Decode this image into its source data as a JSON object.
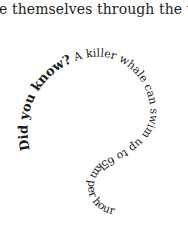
{
  "document": {
    "body_line": "e themselves through the water",
    "curved_text": {
      "lead": "Did you know?",
      "rest": " A killer whale can swim up to 65km per hour"
    },
    "colors": {
      "background": "#ffffff",
      "text": "#1a1a1a"
    }
  }
}
